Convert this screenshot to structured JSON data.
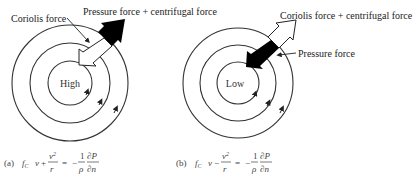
{
  "panel_a": {
    "center_label": "High",
    "coriolis_label": "Coriolis force",
    "pressure_label": "Pressure force + centrifugal force",
    "equation": {
      "tag": "(a)",
      "lhs_term1": "f",
      "lhs_term1_sub": "C",
      "lhs_var": "v",
      "operator": "+",
      "frac1_num": "v",
      "frac1_num_sup": "2",
      "frac1_den": "r",
      "equals": "=",
      "neg": "−",
      "frac2_num": "1",
      "frac2_den": "ρ",
      "frac3_num": "∂P",
      "frac3_den": "∂n"
    }
  },
  "panel_b": {
    "center_label": "Low",
    "coriolis_label": "Coriolis force + centrifugal force",
    "pressure_label": "Pressure force",
    "equation": {
      "tag": "(b)",
      "lhs_term1": "f",
      "lhs_term1_sub": "C",
      "lhs_var": "v",
      "operator": "−",
      "frac1_num": "v",
      "frac1_num_sup": "2",
      "frac1_den": "r",
      "equals": "=",
      "neg": "−",
      "frac2_num": "1",
      "frac2_den": "ρ",
      "frac3_num": "∂P",
      "frac3_den": "∂n"
    }
  },
  "colors": {
    "line": "#333333",
    "pressure_arrow_fill": "#000000",
    "coriolis_arrow_fill": "#ffffff"
  }
}
